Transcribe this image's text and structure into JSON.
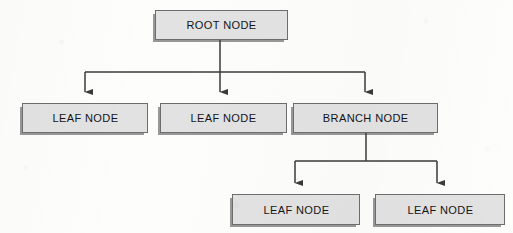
{
  "diagram": {
    "type": "tree-diagram",
    "background_color": "#fdfdfc",
    "node_fill_color": "#e2e2e2",
    "node_border_color": "#6d6d6d",
    "edge_color": "#3a3a3a",
    "text_color": "#14141a",
    "levels": 3,
    "node_count": 6,
    "edge_count": 5
  },
  "nodes": [
    {
      "id": "root",
      "label": "ROOT NODE",
      "level": 0,
      "kind": "root",
      "x": 155,
      "y": 10,
      "w": 133,
      "h": 30
    },
    {
      "id": "leaf-1",
      "label": "LEAF NODE",
      "level": 1,
      "kind": "leaf",
      "x": 22,
      "y": 103,
      "w": 126,
      "h": 30
    },
    {
      "id": "leaf-2",
      "label": "LEAF NODE",
      "level": 1,
      "kind": "leaf",
      "x": 160,
      "y": 103,
      "w": 127,
      "h": 30
    },
    {
      "id": "branch-1",
      "label": "BRANCH NODE",
      "level": 1,
      "kind": "branch",
      "x": 293,
      "y": 103,
      "w": 145,
      "h": 30
    },
    {
      "id": "leaf-3",
      "label": "LEAF NODE",
      "level": 2,
      "kind": "leaf",
      "x": 232,
      "y": 194,
      "w": 128,
      "h": 31
    },
    {
      "id": "leaf-4",
      "label": "LEAF NODE",
      "level": 2,
      "kind": "leaf",
      "x": 375,
      "y": 194,
      "w": 130,
      "h": 31
    }
  ],
  "edges": [
    {
      "id": "edge-root-stem",
      "from": "root",
      "to": "bus-1",
      "kind": "stem",
      "arrow": false
    },
    {
      "id": "edge-root-leaf-1",
      "from": "root",
      "to": "leaf-1",
      "kind": "elbow",
      "arrow": true
    },
    {
      "id": "edge-root-leaf-2",
      "from": "root",
      "to": "leaf-2",
      "kind": "straight",
      "arrow": true
    },
    {
      "id": "edge-root-branch",
      "from": "root",
      "to": "branch-1",
      "kind": "elbow",
      "arrow": true
    },
    {
      "id": "edge-branch-leaf-3",
      "from": "branch-1",
      "to": "leaf-3",
      "kind": "elbow",
      "arrow": true
    },
    {
      "id": "edge-branch-leaf-4",
      "from": "branch-1",
      "to": "leaf-4",
      "kind": "elbow",
      "arrow": true
    }
  ],
  "geometry": {
    "root_stem_x": 220,
    "bus_1_y": 72,
    "bus_1_left_x": 85,
    "bus_1_right_x": 365,
    "bus_1_arrow_tip_y": 100,
    "branch_stem_x": 366,
    "bus_2_y": 161,
    "bus_2_left_x": 295,
    "bus_2_right_x": 437,
    "bus_2_arrow_tip_y": 191
  }
}
